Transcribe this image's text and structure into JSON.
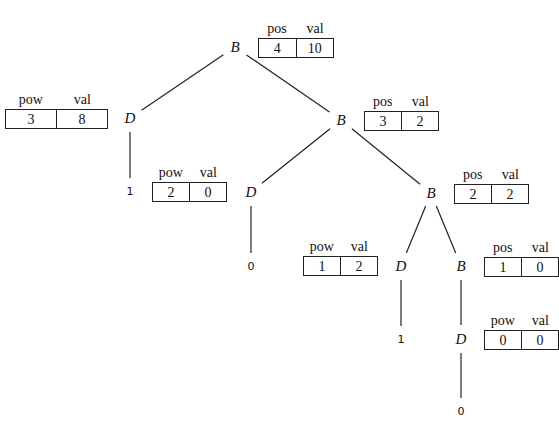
{
  "nodes": {
    "n_root": {
      "label": "B"
    },
    "n_d1": {
      "label": "D"
    },
    "n_b2": {
      "label": "B"
    },
    "n_d2": {
      "label": "D"
    },
    "n_b3": {
      "label": "B"
    },
    "n_d3": {
      "label": "D"
    },
    "n_b4": {
      "label": "B"
    },
    "n_d4": {
      "label": "D"
    }
  },
  "leaves": {
    "l_d1": {
      "label": "1"
    },
    "l_d2": {
      "label": "0"
    },
    "l_d3": {
      "label": "1"
    },
    "l_d4": {
      "label": "0"
    }
  },
  "records": {
    "r_root": {
      "headers": [
        "pos",
        "val"
      ],
      "values": [
        "4",
        "10"
      ]
    },
    "r_d1": {
      "headers": [
        "pow",
        "val"
      ],
      "values": [
        "3",
        "8"
      ]
    },
    "r_b2": {
      "headers": [
        "pos",
        "val"
      ],
      "values": [
        "3",
        "2"
      ]
    },
    "r_d2": {
      "headers": [
        "pow",
        "val"
      ],
      "values": [
        "2",
        "0"
      ]
    },
    "r_b3": {
      "headers": [
        "pos",
        "val"
      ],
      "values": [
        "2",
        "2"
      ]
    },
    "r_d3": {
      "headers": [
        "pow",
        "val"
      ],
      "values": [
        "1",
        "2"
      ]
    },
    "r_b4": {
      "headers": [
        "pos",
        "val"
      ],
      "values": [
        "1",
        "0"
      ]
    },
    "r_d4": {
      "headers": [
        "pow",
        "val"
      ],
      "values": [
        "0",
        "0"
      ]
    }
  },
  "edges": [
    [
      "n_root",
      "n_d1"
    ],
    [
      "n_root",
      "n_b2"
    ],
    [
      "n_d1",
      "l_d1"
    ],
    [
      "n_b2",
      "n_d2"
    ],
    [
      "n_b2",
      "n_b3"
    ],
    [
      "n_d2",
      "l_d2"
    ],
    [
      "n_b3",
      "n_d3"
    ],
    [
      "n_b3",
      "n_b4"
    ],
    [
      "n_d3",
      "l_d3"
    ],
    [
      "n_b4",
      "n_d4"
    ],
    [
      "n_d4",
      "l_d4"
    ]
  ]
}
